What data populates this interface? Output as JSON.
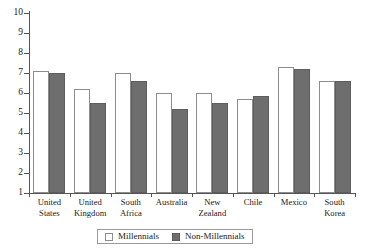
{
  "chart_data": {
    "type": "bar",
    "title": "",
    "subtitle": "",
    "xlabel": "",
    "ylabel": "",
    "ylim": [
      1,
      10
    ],
    "yticks": [
      1,
      2,
      3,
      4,
      5,
      6,
      7,
      8,
      9,
      10
    ],
    "ytick_labels": [
      "1",
      "2",
      "3",
      "4",
      "5",
      "6",
      "7",
      "8",
      "9",
      "10"
    ],
    "grid": false,
    "legend_position": "bottom-center",
    "categories": [
      "United States",
      "United Kingdom",
      "South Africa",
      "Australia",
      "New Zealand",
      "Chile",
      "Mexico",
      "South Korea"
    ],
    "category_lines": [
      [
        "United",
        "States"
      ],
      [
        "United",
        "Kingdom"
      ],
      [
        "South",
        "Africa"
      ],
      [
        "Australia",
        ""
      ],
      [
        "New",
        "Zealand"
      ],
      [
        "Chile",
        ""
      ],
      [
        "Mexico",
        ""
      ],
      [
        "South",
        "Korea"
      ]
    ],
    "series": [
      {
        "name": "Millennials",
        "color": "#ffffff",
        "edge_color": "#8d8d8d",
        "values": [
          7.1,
          6.2,
          7.0,
          6.0,
          6.0,
          5.7,
          7.3,
          6.6
        ]
      },
      {
        "name": "Non-Millennials",
        "color": "#6e6e6e",
        "edge_color": "#5d5d5d",
        "values": [
          7.0,
          5.5,
          6.6,
          5.2,
          5.5,
          5.85,
          7.2,
          6.6
        ]
      }
    ]
  },
  "legend": {
    "items": [
      {
        "label": "Millennials",
        "swatch": "millennials"
      },
      {
        "label": "Non-Millennials",
        "swatch": "nonmillennials"
      }
    ]
  },
  "colors": {
    "millennials_fill": "#ffffff",
    "nonmillennials_fill": "#6e6e6e",
    "axis": "#555555",
    "text": "#1a1a1a",
    "background": "#ffffff"
  }
}
